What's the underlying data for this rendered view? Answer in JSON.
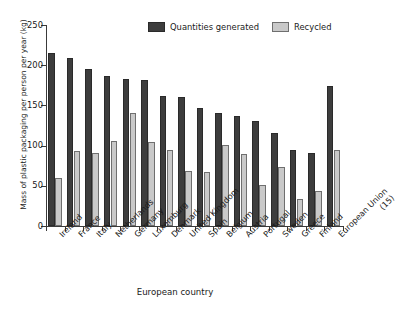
{
  "chart_data": {
    "type": "bar",
    "title": "",
    "xlabel": "European country",
    "ylabel": "Mass of plastic packaging per person per year (kg)",
    "ylim": [
      0,
      250
    ],
    "yticks": [
      0,
      50,
      100,
      150,
      200,
      250
    ],
    "grid": false,
    "legend_position": "top-center",
    "categories": [
      "Ireland",
      "France",
      "Italy",
      "Netherlands",
      "Germany",
      "Luxemburg",
      "Denmark",
      "United Kingdom",
      "Spain",
      "Belgium",
      "Austria",
      "Portugal",
      "Sweden",
      "Greece",
      "Finland",
      "European Union (15)"
    ],
    "series": [
      {
        "name": "Quantities generated",
        "color": "#3d3d3d",
        "values": [
          215,
          209,
          195,
          187,
          183,
          181,
          162,
          160,
          147,
          140,
          137,
          130,
          116,
          95,
          91,
          174
        ]
      },
      {
        "name": "Recycled",
        "color": "#c9c9c9",
        "values": [
          60,
          93,
          91,
          106,
          140,
          104,
          94,
          69,
          67,
          101,
          89,
          51,
          74,
          33,
          44,
          94
        ]
      }
    ]
  },
  "axis": {
    "y_title": "Mass of plastic packaging per person per year (kg)",
    "x_title": "European country",
    "y_ticks": [
      "0",
      "50",
      "100",
      "150",
      "200",
      "250"
    ]
  },
  "legend": {
    "items": [
      {
        "label": "Quantities generated",
        "swatch": "dark-swatch"
      },
      {
        "label": "Recycled",
        "swatch": "light-swatch"
      }
    ]
  },
  "x_labels": [
    "Ireland",
    "France",
    "Italy",
    "Netherlands",
    "Germany",
    "Luxemburg",
    "Denmark",
    "United Kingdom",
    "Spain",
    "Belgium",
    "Austria",
    "Portugal",
    "Sweden",
    "Greece",
    "Finland",
    "European Union",
    "(15)"
  ]
}
